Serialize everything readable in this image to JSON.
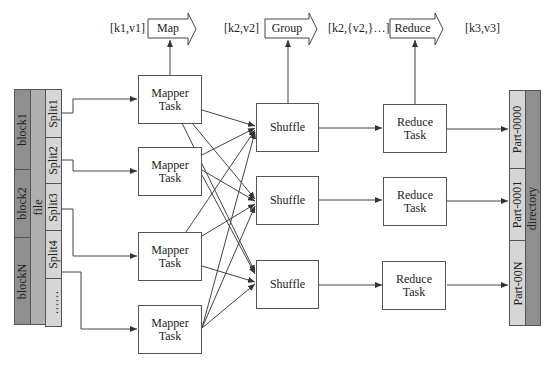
{
  "header": {
    "stage1_input": "[k1,v1]",
    "stage1_op": "Map",
    "stage2_input": "[k2,v2]",
    "stage2_op": "Group",
    "stage3_input": "[k2,{v2,}…]",
    "stage3_op": "Reduce",
    "stage4_output": "[k3,v3]"
  },
  "input": {
    "blocks": [
      "block1",
      "block2",
      "blockN"
    ],
    "file_label": "file",
    "splits": [
      "Split1",
      "Split2",
      "Split3",
      "Split4",
      "……"
    ]
  },
  "mappers": [
    {
      "line1": "Mapper",
      "line2": "Task"
    },
    {
      "line1": "Mapper",
      "line2": "Task"
    },
    {
      "line1": "Mapper",
      "line2": "Task"
    },
    {
      "line1": "Mapper",
      "line2": "Task"
    }
  ],
  "shuffles": [
    {
      "label": "Shuffle"
    },
    {
      "label": "Shuffle"
    },
    {
      "label": "Shuffle"
    }
  ],
  "reducers": [
    {
      "line1": "Reduce",
      "line2": "Task"
    },
    {
      "line1": "Reduce",
      "line2": "Task"
    },
    {
      "line1": "Reduce",
      "line2": "Task"
    }
  ],
  "output": {
    "parts": [
      "Part-0000",
      "Part-0001",
      "Part-00N"
    ],
    "directory_label": "directory"
  },
  "colors": {
    "block_fill": "#8f8f8f",
    "file_fill": "#b0b0b0",
    "split_fill": "#d6d6d6",
    "part_fill": "#d6d6d6",
    "directory_fill": "#8f8f8f",
    "line": "#444444"
  }
}
